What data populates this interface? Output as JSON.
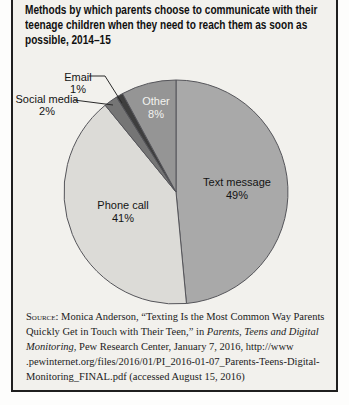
{
  "chart_data": {
    "type": "pie",
    "title": "Methods by which parents choose to communicate with their teenage children when they need to reach them as soon as possible, 2014–15",
    "direction": "clockwise",
    "start_angle_deg": 0,
    "legend": "labels-on-slices",
    "slices": [
      {
        "label": "Text message",
        "value": 49,
        "pct_label": "49%",
        "color": "#a9a9a9",
        "label_color": "#141414",
        "label_placement": "inside"
      },
      {
        "label": "Phone call",
        "value": 41,
        "pct_label": "41%",
        "color": "#dcdbd7",
        "label_color": "#141414",
        "label_placement": "inside"
      },
      {
        "label": "Social media",
        "value": 2,
        "pct_label": "2%",
        "color": "#757575",
        "label_color": "#141414",
        "label_placement": "callout"
      },
      {
        "label": "Email",
        "value": 1,
        "pct_label": "1%",
        "color": "#3e3e3e",
        "label_color": "#141414",
        "label_placement": "callout"
      },
      {
        "label": "Other",
        "value": 8,
        "pct_label": "8%",
        "color": "#959595",
        "label_color": "#f3f3f0",
        "label_placement": "inside"
      }
    ],
    "outline_color": "#55555a",
    "leader_line_color": "#2a2a2a"
  },
  "source": {
    "label": "Source:",
    "part1": " Monica Anderson, “Texting Is the Most Common Way Parents Quickly Get in Touch with Their Teen,” in ",
    "italic": "Parents, Teens and Digital Monitoring",
    "part2": ", Pew Research Center, January 7, 2016, http://www .pewinternet.org/files/2016/01/PI_2016-01-07_Parents-Teens-Digital-Monitoring_FINAL.pdf (accessed August 15, 2016)"
  }
}
